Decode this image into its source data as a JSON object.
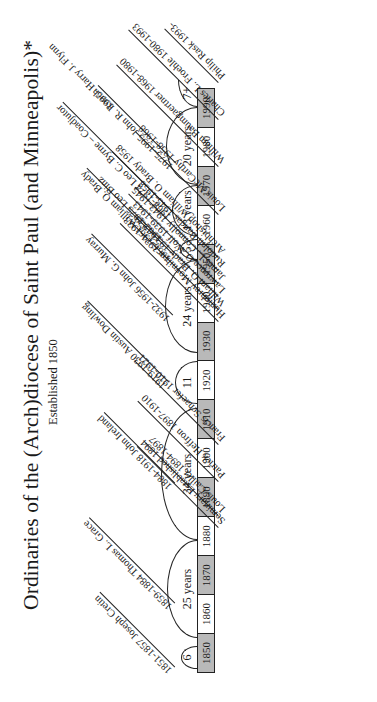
{
  "title": "Ordinaries of the (Arch)diocese of Saint Paul (and Minneapolis)*",
  "subtitle": "Established 1850",
  "decades": [
    "1850",
    "1860",
    "1870",
    "1880",
    "1890",
    "1900",
    "1910",
    "1920",
    "1930",
    "1940",
    "1950",
    "1960",
    "1970",
    "1980",
    "1990"
  ],
  "tenures": [
    {
      "label": "6",
      "start": 1851,
      "end": 1857
    },
    {
      "label": "25 years",
      "start": 1859,
      "end": 1884
    },
    {
      "label": "34 years",
      "start": 1884,
      "end": 1918
    },
    {
      "label": "11",
      "start": 1919,
      "end": 1930
    },
    {
      "label": "24 years",
      "start": 1932,
      "end": 1956
    },
    {
      "label": "5",
      "start": 1956,
      "end": 1961
    },
    {
      "label": "13 years",
      "start": 1962,
      "end": 1975
    },
    {
      "label": "20 years",
      "start": 1975,
      "end": 1995
    },
    {
      "label": "7+",
      "start": 1995,
      "end": 2002
    }
  ],
  "ordinaries": [
    "1851-1857 Joseph Cretin",
    "1859-1884 Thomas L. Grace",
    "1884-1918 John Ireland",
    "1919-1930 Austin Dowling",
    "1932-1956 John G. Murray",
    "1956-1961 William O. Brady",
    "1962-1975 Leo Binz",
    "1968-1974 Leo C. Byrne – Coadjutor",
    "1975-1995 John R. Roach",
    "1995- Harry J. Flynn"
  ],
  "seminary": [
    "Philip Rask 1993-",
    "Charles L. Froehle 1980-1993",
    "William Baumgaertner 1968-1980",
    "Louis McCarthy 1958-1968",
    "Archbishop William O. Brady 1958",
    "Rudolph Bandas 1945-1958",
    "James L. Connolly 1943-1945",
    "Lawrence O. Wolf 1939-1943",
    "William O. Brady 1933-1939",
    "Humphrey Moynihan 1921-1933",
    "Francis Schaefer 1910-1921",
    "Patrick Heffron 1897-1910",
    "Louis Caillet 1894-1897",
    "Seminary Established 1894"
  ]
}
